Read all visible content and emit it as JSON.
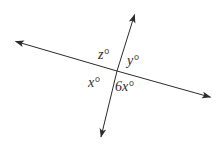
{
  "figure": {
    "type": "geometry-diagram",
    "background_color": "#ffffff",
    "stroke_color": "#2b2b2b",
    "text_color": "#2b2b2b",
    "labels": {
      "top_angle": "z°",
      "right_angle": "y°",
      "left_angle": "x°",
      "bottom_angle": "6x°"
    },
    "geometry": {
      "intersection": [
        117,
        71
      ],
      "line_a": {
        "name": "shallow-line",
        "from": [
          13,
          40
        ],
        "to": [
          213,
          98
        ]
      },
      "line_b": {
        "name": "steep-line",
        "from": [
          137,
          12
        ],
        "to": [
          100,
          140
        ]
      }
    }
  }
}
